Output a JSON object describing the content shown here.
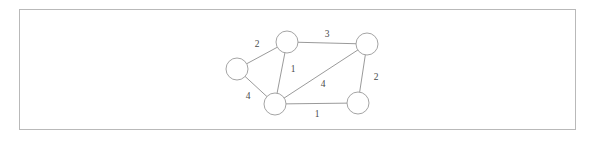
{
  "figure": {
    "background_color": "#ffffff",
    "frame": {
      "x": 19,
      "y": 9,
      "width": 557,
      "height": 121,
      "stroke_color": "#b9b9b9"
    },
    "node_style": {
      "radius": 11,
      "fill_color": "#ffffff",
      "stroke_color": "#9a9a9a"
    },
    "edge_style": {
      "stroke_color": "#8e8e8e"
    },
    "label_color": "#4a4a4a"
  },
  "chart_data": {
    "type": "diagram",
    "diagram_kind": "weighted undirected graph",
    "title": "",
    "nodes": [
      {
        "id": "left",
        "label": "",
        "x": 237,
        "y": 69
      },
      {
        "id": "top",
        "label": "",
        "x": 287,
        "y": 42
      },
      {
        "id": "top-right",
        "label": "",
        "x": 367,
        "y": 44
      },
      {
        "id": "bottom-center",
        "label": "",
        "x": 275,
        "y": 104
      },
      {
        "id": "bottom-right",
        "label": "",
        "x": 358,
        "y": 103
      }
    ],
    "edges": [
      {
        "source": "left",
        "target": "top",
        "weight": "2",
        "label_x": 257,
        "label_y": 45
      },
      {
        "source": "top",
        "target": "top-right",
        "weight": "3",
        "label_x": 327,
        "label_y": 35
      },
      {
        "source": "top",
        "target": "bottom-center",
        "weight": "1",
        "label_x": 293,
        "label_y": 70
      },
      {
        "source": "left",
        "target": "bottom-center",
        "weight": "4",
        "label_x": 248,
        "label_y": 97
      },
      {
        "source": "bottom-center",
        "target": "top-right",
        "weight": "4",
        "label_x": 323,
        "label_y": 85
      },
      {
        "source": "top-right",
        "target": "bottom-right",
        "weight": "2",
        "label_x": 376,
        "label_y": 78
      },
      {
        "source": "bottom-center",
        "target": "bottom-right",
        "weight": "1",
        "label_x": 317,
        "label_y": 115
      }
    ]
  }
}
